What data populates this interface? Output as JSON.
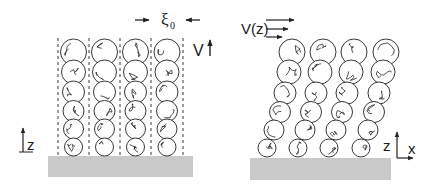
{
  "figure": {
    "left_panel": {
      "name": "static brush",
      "columns": 4,
      "blobs_per_column": 6,
      "labels": {
        "blob_size": "ξ",
        "blob_size_subscript": "0",
        "velocity": "V",
        "height_axis": "z"
      }
    },
    "right_panel": {
      "name": "sheared brush",
      "columns": 4,
      "blobs_per_column": 6,
      "labels": {
        "velocity_profile": "V(z)",
        "axis_z": "z",
        "axis_x": "x"
      }
    },
    "colors": {
      "substrate": "#c9c9c9",
      "line": "#222222",
      "background": "#ffffff"
    }
  }
}
